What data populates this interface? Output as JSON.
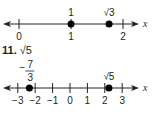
{
  "lines": [
    {
      "id": "top",
      "axis_label": "x",
      "ticks": [
        {
          "value": 0,
          "label": "0"
        },
        {
          "value": 1,
          "label": "1"
        },
        {
          "value": 2,
          "label": "2"
        }
      ],
      "points": [
        {
          "value": 1,
          "label": "1"
        },
        {
          "value": 1.732,
          "label": "√3"
        }
      ]
    },
    {
      "id": "bottom",
      "axis_label": "x",
      "ticks": [
        {
          "value": -3,
          "label": "−3"
        },
        {
          "value": -2,
          "label": "−2"
        },
        {
          "value": -1,
          "label": "−1"
        },
        {
          "value": 0,
          "label": "0"
        },
        {
          "value": 1,
          "label": "1"
        },
        {
          "value": 2,
          "label": "2"
        },
        {
          "value": 3,
          "label": "3"
        }
      ],
      "points": [
        {
          "value": -2.333,
          "label_num": "7",
          "label_den": "3",
          "label_sign": "−"
        },
        {
          "value": 2.236,
          "label": "√5"
        }
      ]
    }
  ],
  "problem": {
    "number": "11.",
    "expression": "√5"
  }
}
